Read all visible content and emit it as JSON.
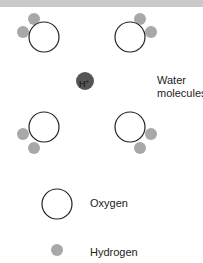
{
  "diagram": {
    "labels": {
      "water_line1": "Water",
      "water_line2": "molecules",
      "ion": "H+",
      "ion_symbol": "H",
      "ion_charge": "+"
    },
    "legend": {
      "oxygen": "Oxygen",
      "hydrogen": "Hydrogen"
    },
    "colors": {
      "oxygen_stroke": "#222222",
      "hydrogen_fill": "#a8a8a8",
      "ion_fill": "#555555",
      "top_band": "#c9c9c9"
    },
    "molecules": [
      {
        "oxygen": [
          44,
          37
        ],
        "hydrogens": [
          [
            34,
            19
          ],
          [
            23,
            32
          ]
        ]
      },
      {
        "oxygen": [
          130,
          37
        ],
        "hydrogens": [
          [
            140,
            19
          ],
          [
            151,
            32
          ]
        ]
      },
      {
        "oxygen": [
          44,
          127
        ],
        "hydrogens": [
          [
            23,
            134
          ],
          [
            34,
            149
          ]
        ]
      },
      {
        "oxygen": [
          130,
          127
        ],
        "hydrogens": [
          [
            151,
            134
          ],
          [
            140,
            149
          ]
        ]
      }
    ]
  }
}
